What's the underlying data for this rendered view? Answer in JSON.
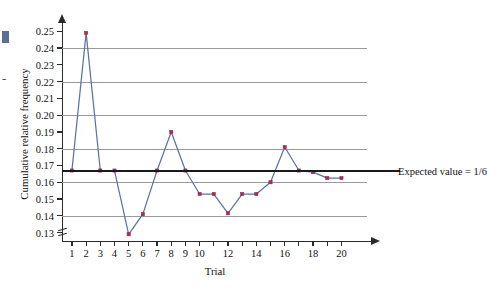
{
  "margin_bleed": {
    "text": "e\nt\ne\ny"
  },
  "chart_data": {
    "type": "line",
    "title": "",
    "xlabel": "Trial",
    "ylabel": "Cumulative relative frequency",
    "x": [
      1,
      2,
      3,
      4,
      5,
      6,
      7,
      8,
      9,
      10,
      11,
      12,
      13,
      14,
      15,
      16,
      17,
      18,
      19,
      20
    ],
    "values": [
      0.167,
      0.249,
      0.167,
      0.167,
      0.129,
      0.141,
      0.167,
      0.19,
      0.167,
      0.153,
      0.153,
      0.1415,
      0.153,
      0.153,
      0.16,
      0.181,
      0.167,
      0.166,
      0.1625,
      0.1625
    ],
    "series": [
      {
        "name": "Cumulative relative frequency",
        "values": [
          0.167,
          0.249,
          0.167,
          0.167,
          0.129,
          0.141,
          0.167,
          0.19,
          0.167,
          0.153,
          0.153,
          0.1415,
          0.153,
          0.153,
          0.16,
          0.181,
          0.167,
          0.166,
          0.1625,
          0.1625
        ],
        "line_color": "#5d72a6",
        "marker_color": "#b02a56"
      }
    ],
    "xlim": [
      0.3,
      21.8
    ],
    "ylim": [
      0.125,
      0.2555
    ],
    "yticks": [
      0.13,
      0.14,
      0.15,
      0.16,
      0.17,
      0.18,
      0.19,
      0.2,
      0.21,
      0.22,
      0.23,
      0.24,
      0.25
    ],
    "ytick_labels": [
      "0.13",
      "0.14",
      "0.15",
      "0.16",
      "0.17",
      "0.18",
      "0.19",
      "0.20",
      "0.21",
      "0.22",
      "0.23",
      "0.24",
      "0.25"
    ],
    "gridlines_y": [
      0.14,
      0.16,
      0.18,
      0.2,
      0.22,
      0.24
    ],
    "grid": true,
    "xticks": [
      1,
      2,
      3,
      4,
      5,
      6,
      7,
      8,
      9,
      10,
      11,
      12,
      13,
      14,
      15,
      16,
      17,
      18,
      19,
      20
    ],
    "xtick_labels": [
      {
        "x": 1,
        "label": "1"
      },
      {
        "x": 2,
        "label": "2"
      },
      {
        "x": 3,
        "label": "3"
      },
      {
        "x": 4,
        "label": "4"
      },
      {
        "x": 5,
        "label": "5"
      },
      {
        "x": 6,
        "label": "6"
      },
      {
        "x": 7,
        "label": "7"
      },
      {
        "x": 8,
        "label": "8"
      },
      {
        "x": 9,
        "label": "9"
      },
      {
        "x": 10,
        "label": "10"
      },
      {
        "x": 12,
        "label": "12"
      },
      {
        "x": 14,
        "label": "14"
      },
      {
        "x": 16,
        "label": "16"
      },
      {
        "x": 18,
        "label": "18"
      },
      {
        "x": 20,
        "label": "20"
      }
    ],
    "y_axis_break": true,
    "annotations": [
      {
        "name": "expected-value-line",
        "label": "Expected value = 1/6",
        "y": 0.16667,
        "color": "#1a1a1a"
      }
    ],
    "legend": "none"
  }
}
